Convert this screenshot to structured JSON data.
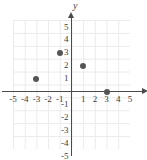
{
  "chart_data": {
    "type": "scatter",
    "title": "",
    "xlabel": "",
    "ylabel": "y",
    "xlim": [
      -5,
      5
    ],
    "ylim": [
      -5,
      5
    ],
    "grid": true,
    "legend": "none",
    "x_ticks": [
      "-5",
      "-4",
      "-3",
      "-2",
      "-1",
      "1",
      "2",
      "3",
      "4",
      "5"
    ],
    "y_ticks": [
      "5",
      "4",
      "3",
      "2",
      "1",
      "-1",
      "-2",
      "-3",
      "-4",
      "-5"
    ],
    "points": [
      {
        "label": "(-3, 1)",
        "x": -3,
        "y": 1
      },
      {
        "label": "(-1, 3)",
        "x": -1,
        "y": 3
      },
      {
        "label": "(1, 2)",
        "x": 1,
        "y": 2
      },
      {
        "label": "(3, 0)",
        "x": 3,
        "y": 0
      }
    ],
    "colors": {
      "point": "#555555",
      "axis": "#4a4a4a",
      "grid": "#ebebeb",
      "background": "#ffffff",
      "text": "#3d3d3d"
    }
  }
}
